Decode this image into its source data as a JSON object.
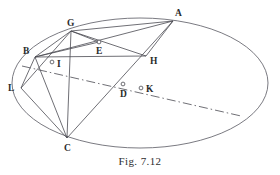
{
  "figure": {
    "caption": "Fig. 7.12",
    "type": "geometric-diagram",
    "background_color": "#ffffff",
    "stroke_color": "#4a4a52",
    "label_color": "#2b2b2b",
    "canvas": {
      "width": 280,
      "height": 175
    }
  },
  "ellipse": {
    "name": "conic-outline",
    "center_x": 140,
    "center_y": 83,
    "radius_x": 128,
    "radius_y": 65,
    "rotation_deg": 0,
    "stroke_color": "#6b6b73",
    "stroke_width": 0.9
  },
  "points": [
    {
      "id": "A",
      "label": "A",
      "x": 173,
      "y": 21,
      "on_curve": true,
      "marker": "none",
      "label_dx": 2,
      "label_dy": -12
    },
    {
      "id": "G",
      "label": "G",
      "x": 71,
      "y": 31,
      "on_curve": true,
      "marker": "none",
      "label_dx": -4,
      "label_dy": -12
    },
    {
      "id": "B",
      "label": "B",
      "x": 35,
      "y": 57,
      "on_curve": true,
      "marker": "none",
      "label_dx": -12,
      "label_dy": -10
    },
    {
      "id": "E",
      "label": "E",
      "x": 99,
      "y": 42,
      "on_curve": false,
      "marker": "circle",
      "label_dx": -3,
      "label_dy": 5
    },
    {
      "id": "H",
      "label": "H",
      "x": 146,
      "y": 56,
      "on_curve": false,
      "marker": "none",
      "label_dx": 4,
      "label_dy": 1
    },
    {
      "id": "I",
      "label": "I",
      "x": 52,
      "y": 62,
      "on_curve": false,
      "marker": "circle",
      "label_dx": 5,
      "label_dy": -2
    },
    {
      "id": "L",
      "label": "L",
      "x": 21,
      "y": 88,
      "on_curve": true,
      "marker": "none",
      "label_dx": -13,
      "label_dy": -4
    },
    {
      "id": "D",
      "label": "D",
      "x": 123,
      "y": 84,
      "on_curve": false,
      "marker": "circle",
      "label_dx": -3,
      "label_dy": 6
    },
    {
      "id": "K",
      "label": "K",
      "x": 141,
      "y": 88,
      "on_curve": false,
      "marker": "circle",
      "label_dx": 5,
      "label_dy": -3
    },
    {
      "id": "C",
      "label": "C",
      "x": 67,
      "y": 138,
      "on_curve": true,
      "marker": "none",
      "label_dx": -3,
      "label_dy": 6
    }
  ],
  "segments": [
    {
      "name": "chord-G-A",
      "from": "G",
      "to": "A",
      "style": "solid"
    },
    {
      "name": "chord-B-A",
      "from": "B",
      "to": "A",
      "style": "solid"
    },
    {
      "name": "chord-B-G",
      "from": "B",
      "to": "G",
      "style": "solid"
    },
    {
      "name": "chord-G-H",
      "from": "G",
      "to": "H",
      "style": "solid"
    },
    {
      "name": "chord-A-H",
      "from": "A",
      "to": "H",
      "style": "solid"
    },
    {
      "name": "chord-B-H",
      "from": "B",
      "to": "H",
      "style": "solid"
    },
    {
      "name": "chord-A-C",
      "from": "A",
      "to": "C",
      "style": "solid"
    },
    {
      "name": "chord-B-C",
      "from": "B",
      "to": "C",
      "style": "solid"
    },
    {
      "name": "chord-B-L",
      "from": "B",
      "to": "L",
      "style": "solid"
    },
    {
      "name": "chord-L-C",
      "from": "L",
      "to": "C",
      "style": "solid"
    },
    {
      "name": "chord-L-G",
      "from": "L",
      "to": "G",
      "style": "solid"
    },
    {
      "name": "chord-G-C",
      "from": "G",
      "to": "C",
      "style": "solid"
    },
    {
      "name": "chord-B-E",
      "from": "B",
      "to": "E",
      "style": "solid"
    },
    {
      "name": "chord-E-G",
      "from": "E",
      "to": "G",
      "style": "solid"
    }
  ],
  "dash_dot_line": {
    "name": "axis-through-D-K",
    "x1": 22,
    "y1": 66,
    "x2": 241,
    "y2": 116,
    "style": "dash-dot",
    "passes_through": [
      "I",
      "D",
      "K"
    ]
  }
}
